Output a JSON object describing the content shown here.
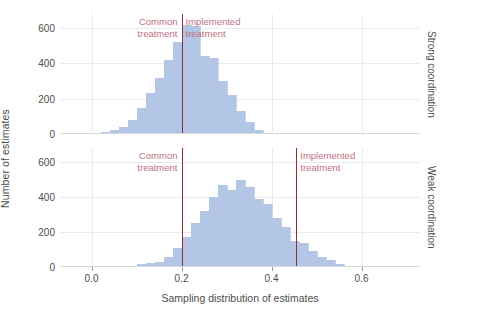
{
  "axes": {
    "ylabel": "Number of estimates",
    "xlabel": "Sampling distribution of estimates",
    "yticks": [
      0,
      200,
      400,
      600
    ],
    "xticks": [
      0.0,
      0.2,
      0.4,
      0.6
    ],
    "xtick_labels": [
      "0.0",
      "0.2",
      "0.4",
      "0.6"
    ],
    "ylim": [
      0,
      680
    ],
    "xlim": [
      -0.07,
      0.73
    ]
  },
  "panels": [
    {
      "strip_label": "Strong coordination",
      "annotations": [
        {
          "text": "Common\ntreatment",
          "x": 0.2,
          "align": "right"
        },
        {
          "text": "Implemented\ntreatment",
          "x": 0.2,
          "align": "left"
        }
      ],
      "reflines": [
        {
          "x": 0.2,
          "label": "common-and-implemented-treatment"
        }
      ]
    },
    {
      "strip_label": "Weak coordination",
      "annotations": [
        {
          "text": "Common\ntreatment",
          "x": 0.2,
          "align": "right"
        },
        {
          "text": "Implemented\ntreatment",
          "x": 0.455,
          "align": "left"
        }
      ],
      "reflines": [
        {
          "x": 0.2,
          "label": "common-treatment"
        },
        {
          "x": 0.455,
          "label": "implemented-treatment"
        }
      ]
    }
  ],
  "colors": {
    "bar_fill": "#b3c6e6",
    "refline": "#8b2f3d",
    "annotation_text": "#c0707f",
    "axis_text": "#4d4d4d",
    "gridline": "#ebebeb"
  },
  "chart_data": {
    "type": "bar",
    "title": "",
    "xlabel": "Sampling distribution of estimates",
    "ylabel": "Number of estimates",
    "ylim": [
      0,
      680
    ],
    "xlim": [
      -0.07,
      0.73
    ],
    "grid": true,
    "legend": "none",
    "bin_width": 0.02,
    "facets": [
      {
        "name": "Strong coordination",
        "series": [
          {
            "name": "Number of estimates",
            "bin_starts": [
              0.02,
              0.04,
              0.06,
              0.08,
              0.1,
              0.12,
              0.14,
              0.16,
              0.18,
              0.2,
              0.22,
              0.24,
              0.26,
              0.28,
              0.3,
              0.32,
              0.34,
              0.36
            ],
            "values": [
              10,
              20,
              40,
              80,
              150,
              230,
              320,
              420,
              520,
              620,
              610,
              440,
              430,
              300,
              220,
              130,
              70,
              25
            ]
          }
        ],
        "reference_lines": [
          {
            "x": 0.2,
            "label": "Common treatment / Implemented treatment",
            "color": "#8b2f3d"
          }
        ]
      },
      {
        "name": "Weak coordination",
        "series": [
          {
            "name": "Number of estimates",
            "bin_starts": [
              0.08,
              0.1,
              0.12,
              0.14,
              0.16,
              0.18,
              0.2,
              0.22,
              0.24,
              0.26,
              0.28,
              0.3,
              0.32,
              0.34,
              0.36,
              0.38,
              0.4,
              0.42,
              0.44,
              0.46,
              0.48,
              0.5,
              0.52,
              0.54,
              0.56
            ],
            "values": [
              5,
              15,
              25,
              30,
              60,
              110,
              170,
              250,
              320,
              400,
              470,
              440,
              500,
              460,
              390,
              360,
              280,
              230,
              150,
              140,
              90,
              60,
              40,
              20,
              8
            ]
          }
        ],
        "reference_lines": [
          {
            "x": 0.2,
            "label": "Common treatment",
            "color": "#8b2f3d"
          },
          {
            "x": 0.455,
            "label": "Implemented treatment",
            "color": "#8b2f3d"
          }
        ]
      }
    ]
  }
}
